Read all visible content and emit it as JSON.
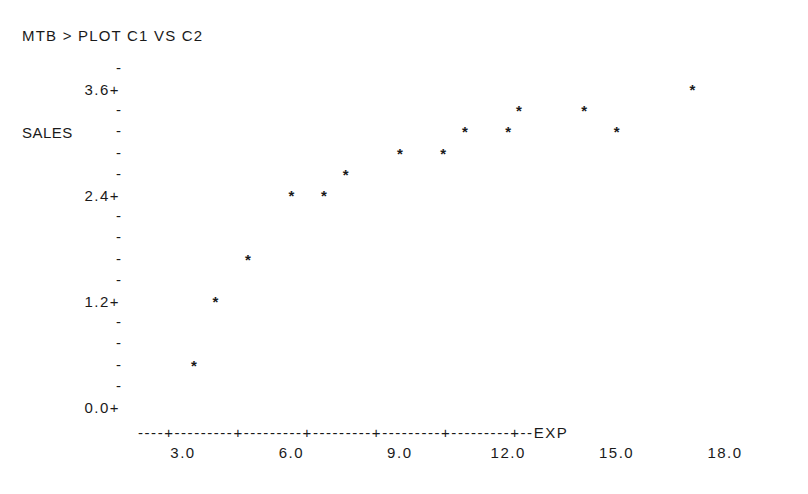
{
  "session": {
    "command": "MTB > PLOT C1 VS C2"
  },
  "chart_data": {
    "type": "scatter",
    "title": "",
    "xlabel": "EXP",
    "ylabel": "SALES",
    "marker": "*",
    "xlim": [
      2.0,
      19.5
    ],
    "ylim": [
      0.0,
      3.6
    ],
    "x_ticks": [
      3.0,
      6.0,
      9.0,
      12.0,
      15.0,
      18.0
    ],
    "x_tick_labels": [
      "3.0",
      "6.0",
      "9.0",
      "12.0",
      "15.0",
      "18.0"
    ],
    "y_ticks": [
      0.0,
      1.2,
      2.4,
      3.6
    ],
    "y_tick_labels": [
      "0.0+",
      "1.2+",
      "2.4+",
      "3.6+"
    ],
    "y_minor_step": 0.24,
    "grid": false,
    "legend": null,
    "points": [
      {
        "x": 3.3,
        "y": 0.48
      },
      {
        "x": 3.9,
        "y": 1.2
      },
      {
        "x": 4.8,
        "y": 1.68
      },
      {
        "x": 6.0,
        "y": 2.4
      },
      {
        "x": 6.9,
        "y": 2.4
      },
      {
        "x": 7.5,
        "y": 2.64
      },
      {
        "x": 9.0,
        "y": 2.88
      },
      {
        "x": 10.2,
        "y": 2.88
      },
      {
        "x": 10.8,
        "y": 3.12
      },
      {
        "x": 12.0,
        "y": 3.12
      },
      {
        "x": 12.3,
        "y": 3.36
      },
      {
        "x": 14.1,
        "y": 3.36
      },
      {
        "x": 15.0,
        "y": 3.12
      },
      {
        "x": 17.1,
        "y": 3.6
      }
    ],
    "x_axis_line": "----+---------+---------+---------+---------+---------+--EXP"
  }
}
